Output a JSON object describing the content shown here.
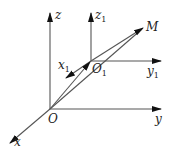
{
  "diagram": {
    "type": "coordinate-frames-3d",
    "colors": {
      "line": "#444444",
      "arrow": "#111111",
      "text": "#222222"
    },
    "frames": [
      {
        "name": "fixed",
        "origin_label": "O",
        "axes": [
          {
            "label": "x",
            "sub": ""
          },
          {
            "label": "y",
            "sub": ""
          },
          {
            "label": "z",
            "sub": ""
          }
        ]
      },
      {
        "name": "moving",
        "origin_label": "O",
        "origin_sub": "1",
        "axes": [
          {
            "label": "x",
            "sub": "1"
          },
          {
            "label": "y",
            "sub": "1"
          },
          {
            "label": "z",
            "sub": "1"
          }
        ]
      }
    ],
    "point": {
      "label": "M"
    }
  }
}
